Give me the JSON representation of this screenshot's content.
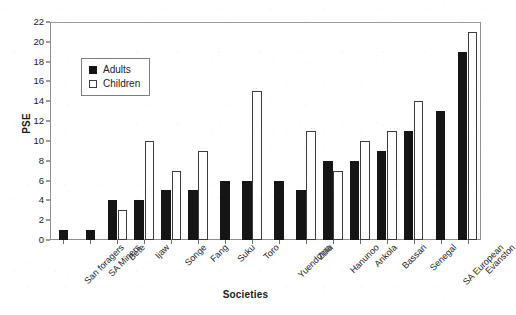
{
  "chart_data": {
    "type": "bar",
    "title": "",
    "xlabel": "Societies",
    "ylabel": "PSE",
    "ylim": [
      0,
      22
    ],
    "ytick_step": 2,
    "yticks": [
      0,
      2,
      4,
      6,
      8,
      10,
      12,
      14,
      16,
      18,
      20,
      22
    ],
    "grid": false,
    "legend_position": "upper-left-inside",
    "categories": [
      "San foragers",
      "SA Miners",
      "Bete",
      "Ijaw",
      "Songe",
      "Fang",
      "Suku",
      "Toro",
      "Yuenduma",
      "Zulu",
      "Hanunoo",
      "Ankola",
      "Bassari",
      "Senegal",
      "SA European",
      "Evanston"
    ],
    "series": [
      {
        "name": "Adults",
        "color": "#151515",
        "fill": "solid",
        "values": [
          1,
          1,
          4,
          4,
          5,
          5,
          6,
          6,
          6,
          5,
          8,
          8,
          9,
          11,
          13,
          19
        ]
      },
      {
        "name": "Children",
        "color": "#ffffff",
        "fill": "hollow",
        "values": [
          null,
          null,
          3,
          10,
          7,
          9,
          null,
          15,
          null,
          11,
          7,
          10,
          11,
          14,
          null,
          21
        ]
      }
    ]
  },
  "legend": {
    "items": [
      {
        "label": "Adults",
        "swatch": "filled-square-icon"
      },
      {
        "label": "Children",
        "swatch": "hollow-square-icon"
      }
    ]
  }
}
